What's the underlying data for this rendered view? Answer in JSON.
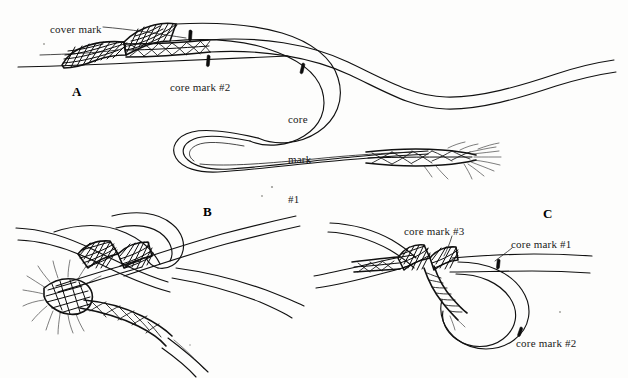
{
  "figure": {
    "kind": "technical-line-drawing",
    "background_color": "#fdfdfc",
    "ink_color": "#111111"
  },
  "panels": [
    {
      "id": "A",
      "letter": "A",
      "letter_pos": {
        "x": 72,
        "y": 84
      },
      "labels": [
        {
          "name": "cover-mark",
          "text": "cover mark",
          "x": 50,
          "y": 23,
          "lines": [
            "cover mark"
          ]
        },
        {
          "name": "core-mark-2",
          "text": "core mark #2",
          "x": 170,
          "y": 81,
          "lines": [
            "core mark #2"
          ]
        },
        {
          "name": "core-mark-1",
          "text": "core mark #1",
          "x": 288,
          "y": 86,
          "lines": [
            "core",
            "mark",
            "#1"
          ]
        }
      ]
    },
    {
      "id": "B",
      "letter": "B",
      "letter_pos": {
        "x": 203,
        "y": 204
      },
      "labels": []
    },
    {
      "id": "C",
      "letter": "C",
      "letter_pos": {
        "x": 543,
        "y": 206
      },
      "labels": [
        {
          "name": "core-mark-3",
          "text": "core mark #3",
          "x": 404,
          "y": 225,
          "lines": [
            "core mark #3"
          ]
        },
        {
          "name": "core-mark-1",
          "text": "core mark #1",
          "x": 511,
          "y": 238,
          "lines": [
            "core mark #1"
          ]
        },
        {
          "name": "core-mark-2",
          "text": "core mark #2",
          "x": 516,
          "y": 337,
          "lines": [
            "core mark #2"
          ]
        }
      ]
    }
  ],
  "colors": {
    "ink": "#111111",
    "paper": "#fdfdfc",
    "tick": "#0d0d0d"
  }
}
